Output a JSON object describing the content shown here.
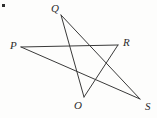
{
  "figure": {
    "width": 157,
    "height": 118,
    "background_color": "#fdfdfc",
    "line_color": "#3a3a3a",
    "line_width": 1,
    "label_color": "#2b2b2b"
  },
  "marker": {
    "name": "corner-dot",
    "x": 2,
    "y": 4,
    "color": "#2e2e2e"
  },
  "points": [
    {
      "id": "P",
      "label": "P",
      "x": 21,
      "y": 47,
      "label_x": 10,
      "label_y": 40
    },
    {
      "id": "Q",
      "label": "Q",
      "x": 61,
      "y": 15,
      "label_x": 51,
      "label_y": 3
    },
    {
      "id": "R",
      "label": "R",
      "x": 118,
      "y": 45,
      "label_x": 123,
      "label_y": 37
    },
    {
      "id": "O",
      "label": "O",
      "x": 84,
      "y": 97,
      "label_x": 74,
      "label_y": 100
    },
    {
      "id": "S",
      "label": "S",
      "x": 140,
      "y": 99,
      "label_x": 145,
      "label_y": 101
    }
  ],
  "segments": [
    {
      "id": "PR",
      "from": "P",
      "to": "R",
      "name": "segment-p-r"
    },
    {
      "id": "PS",
      "from": "P",
      "to": "S",
      "name": "segment-p-s"
    },
    {
      "id": "QO",
      "from": "Q",
      "to": "O",
      "name": "segment-q-o"
    },
    {
      "id": "QS",
      "from": "Q",
      "to": "S",
      "name": "segment-q-s"
    },
    {
      "id": "RO",
      "from": "R",
      "to": "O",
      "name": "segment-r-o"
    }
  ]
}
